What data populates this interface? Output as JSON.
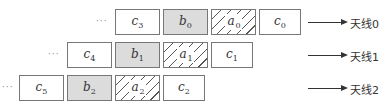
{
  "rows": [
    {
      "ellipsis": "···",
      "cells": [
        {
          "var": "c",
          "sub": "3",
          "style": "plain"
        },
        {
          "var": "b",
          "sub": "0",
          "style": "gray"
        },
        {
          "var": "a",
          "sub": "0",
          "style": "hatch"
        },
        {
          "var": "c",
          "sub": "0",
          "style": "plain"
        }
      ],
      "antenna_label": "天线0"
    },
    {
      "ellipsis": "···",
      "cells": [
        {
          "var": "c",
          "sub": "4",
          "style": "plain"
        },
        {
          "var": "b",
          "sub": "1",
          "style": "gray"
        },
        {
          "var": "a",
          "sub": "1",
          "style": "hatch"
        },
        {
          "var": "c",
          "sub": "1",
          "style": "plain"
        }
      ],
      "antenna_label": "天线1"
    },
    {
      "ellipsis": "···",
      "cells": [
        {
          "var": "c",
          "sub": "5",
          "style": "plain"
        },
        {
          "var": "b",
          "sub": "2",
          "style": "gray"
        },
        {
          "var": "a",
          "sub": "2",
          "style": "hatch"
        },
        {
          "var": "c",
          "sub": "2",
          "style": "plain"
        }
      ],
      "antenna_label": "天线2"
    }
  ]
}
